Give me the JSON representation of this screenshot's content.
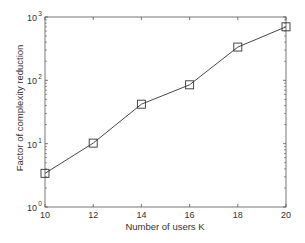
{
  "chart_data": {
    "type": "line",
    "title": "",
    "xlabel": "Number of users K",
    "ylabel": "Factor of complexity reduction",
    "x": [
      10,
      12,
      14,
      16,
      18,
      20
    ],
    "series": [
      {
        "name": "complexity reduction",
        "values": [
          3.4,
          10.2,
          42,
          85,
          335,
          700
        ],
        "marker": "square",
        "color": "#333333"
      }
    ],
    "xlim": [
      10,
      20
    ],
    "ylim": [
      1,
      1000
    ],
    "yscale": "log",
    "x_ticks": [
      10,
      12,
      14,
      16,
      18,
      20
    ],
    "x_tick_labels": [
      "10",
      "12",
      "14",
      "16",
      "18",
      "20"
    ],
    "y_ticks": [
      1,
      10,
      100,
      1000
    ],
    "y_tick_labels": [
      {
        "base": "10",
        "exp": "0"
      },
      {
        "base": "10",
        "exp": "1"
      },
      {
        "base": "10",
        "exp": "2"
      },
      {
        "base": "10",
        "exp": "3"
      }
    ],
    "grid": false,
    "legend": null
  }
}
